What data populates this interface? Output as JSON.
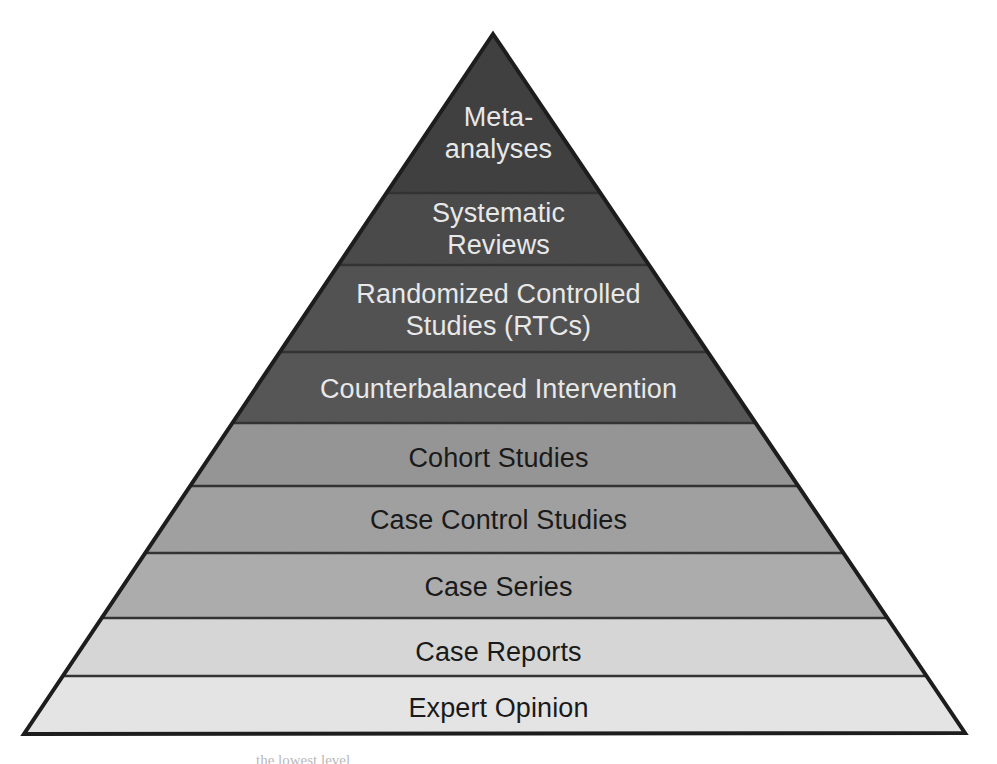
{
  "figure": {
    "name": "hierarchy-of-evidence-pyramid",
    "background_color": "#ffffff",
    "outline_color": "#1d1d1d",
    "geometry": {
      "apex_x": 493,
      "apex_y": 34,
      "base_left_x": 24,
      "base_left_y": 734,
      "base_right_x": 965,
      "base_right_y": 733
    },
    "tiers": [
      {
        "rank": 1,
        "label": "Meta-\nanalyses",
        "plain_label": "Meta-analyses",
        "fill": "#2e2e2e",
        "text_color": "#e8e8e8",
        "text_tone": "light",
        "top_y": 34,
        "bottom_y": 193,
        "font_size": 27,
        "label_center_y": 133
      },
      {
        "rank": 2,
        "label": "Systematic\nReviews",
        "plain_label": "Systematic Reviews",
        "fill": "#3a3a3a",
        "text_color": "#e8e8e8",
        "text_tone": "light",
        "top_y": 193,
        "bottom_y": 265,
        "font_size": 27,
        "label_center_y": 229
      },
      {
        "rank": 3,
        "label": "Randomized Controlled\nStudies (RTCs)",
        "plain_label": "Randomized Controlled Studies (RTCs)",
        "fill": "#454545",
        "text_color": "#e8e8e8",
        "text_tone": "light",
        "top_y": 265,
        "bottom_y": 352,
        "font_size": 27,
        "label_center_y": 310
      },
      {
        "rank": 4,
        "label": "Counterbalanced Intervention",
        "plain_label": "Counterbalanced Intervention",
        "fill": "#4a4a4a",
        "text_color": "#e8e8e8",
        "text_tone": "light",
        "top_y": 352,
        "bottom_y": 423,
        "font_size": 27,
        "label_center_y": 390
      },
      {
        "rank": 5,
        "label": "Cohort Studies",
        "plain_label": "Cohort Studies",
        "fill": "#9a9a9a",
        "text_color": "#1a1a1a",
        "text_tone": "dark",
        "top_y": 423,
        "bottom_y": 486,
        "font_size": 27,
        "label_center_y": 459
      },
      {
        "rank": 6,
        "label": "Case Control Studies",
        "plain_label": "Case Control Studies",
        "fill": "#a8a8a8",
        "text_color": "#1a1a1a",
        "text_tone": "dark",
        "top_y": 486,
        "bottom_y": 553,
        "font_size": 27,
        "label_center_y": 521
      },
      {
        "rank": 7,
        "label": "Case Series",
        "plain_label": "Case Series",
        "fill": "#b8b8b8",
        "text_color": "#1a1a1a",
        "text_tone": "dark",
        "top_y": 553,
        "bottom_y": 618,
        "font_size": 27,
        "label_center_y": 588
      },
      {
        "rank": 8,
        "label": "Case Reports",
        "plain_label": "Case Reports",
        "fill": "#eeeeee",
        "text_color": "#1a1a1a",
        "text_tone": "dark",
        "top_y": 618,
        "bottom_y": 676,
        "font_size": 27,
        "label_center_y": 653
      },
      {
        "rank": 9,
        "label": "Expert Opinion",
        "plain_label": "Expert Opinion",
        "fill": "#ffffff",
        "text_color": "#1a1a1a",
        "text_tone": "dark",
        "top_y": 676,
        "bottom_y": 734,
        "font_size": 27,
        "label_center_y": 709
      }
    ]
  },
  "chart_data": {
    "type": "pyramid",
    "title": "",
    "orientation": "apex-up",
    "categories": [
      "Meta-analyses",
      "Systematic Reviews",
      "Randomized Controlled Studies (RTCs)",
      "Counterbalanced Intervention",
      "Cohort Studies",
      "Case Control Studies",
      "Case Series",
      "Case Reports",
      "Expert Opinion"
    ],
    "values": [
      1,
      2,
      3,
      4,
      5,
      6,
      7,
      8,
      9
    ],
    "value_meaning": "rank from strongest (1) to weakest (9) evidence",
    "band_heights_px": [
      159,
      72,
      87,
      71,
      63,
      67,
      65,
      58,
      58
    ],
    "colors": [
      "#2e2e2e",
      "#3a3a3a",
      "#454545",
      "#4a4a4a",
      "#9a9a9a",
      "#a8a8a8",
      "#b8b8b8",
      "#eeeeee",
      "#ffffff"
    ],
    "xlabel": "",
    "ylabel": "",
    "grid": false,
    "legend": "none"
  },
  "caption": {
    "sliver_text": "the lowest level"
  }
}
